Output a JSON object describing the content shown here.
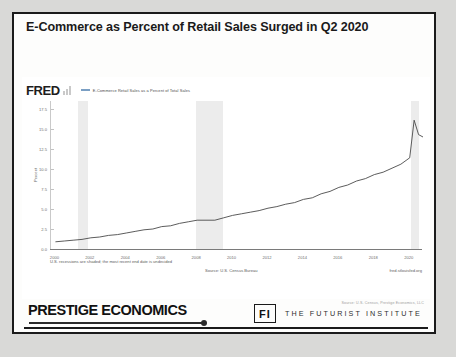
{
  "slide": {
    "title": "E-Commerce as Percent of Retail Sales Surged in Q2 2020",
    "source_note": "Source: U.S. Census, Prestige Economics, LLC"
  },
  "fred": {
    "logo": "FRED",
    "logo_mark": "bar-chart-icon",
    "legend_label": "E-Commerce Retail Sales as a Percent of Total Sales",
    "legend_color": "#7b9fc4",
    "footnote_left": "U.S. recessions are shaded; the most recent end date is undecided",
    "footnote_source": "Source: U.S. Census Bureau",
    "footnote_url": "fred.stlouisfed.org"
  },
  "brand": {
    "prestige": "PRESTIGE ECONOMICS",
    "fi_mark": "FI",
    "fi_words": "THE FUTURIST INSTITUTE"
  },
  "chart_data": {
    "type": "line",
    "title": "E-Commerce as Percent of Retail Sales Surged in Q2 2020",
    "xlabel": "",
    "ylabel": "Percent",
    "legend_position": "top",
    "grid": false,
    "xlim": [
      1999.75,
      2020.75
    ],
    "ylim": [
      0,
      18.5
    ],
    "yticks": [
      "0.0",
      "2.5",
      "5.0",
      "7.5",
      "10.0",
      "12.5",
      "15.0",
      "17.5"
    ],
    "ytick_values": [
      0.0,
      2.5,
      5.0,
      7.5,
      10.0,
      12.5,
      15.0,
      17.5
    ],
    "xticks": [
      "2000",
      "2002",
      "2004",
      "2006",
      "2008",
      "2010",
      "2012",
      "2014",
      "2016",
      "2018",
      "2020"
    ],
    "xtick_values": [
      2000,
      2002,
      2004,
      2006,
      2008,
      2010,
      2012,
      2014,
      2016,
      2018,
      2020
    ],
    "shaded_regions": [
      {
        "label": "2001 recession",
        "start": 2001.25,
        "end": 2001.83
      },
      {
        "label": "2008-2009 recession",
        "start": 2007.95,
        "end": 2009.45
      },
      {
        "label": "2020 recession",
        "start": 2020.1,
        "end": 2020.5
      }
    ],
    "series": [
      {
        "name": "E-Commerce Retail Sales as a Percent of Total Sales",
        "color": "#4a4a4a",
        "x": [
          2000.0,
          2000.5,
          2001.0,
          2001.5,
          2002.0,
          2002.5,
          2003.0,
          2003.5,
          2004.0,
          2004.5,
          2005.0,
          2005.5,
          2006.0,
          2006.5,
          2007.0,
          2007.5,
          2008.0,
          2008.5,
          2009.0,
          2009.5,
          2010.0,
          2010.5,
          2011.0,
          2011.5,
          2012.0,
          2012.5,
          2013.0,
          2013.5,
          2014.0,
          2014.5,
          2015.0,
          2015.5,
          2016.0,
          2016.5,
          2017.0,
          2017.5,
          2018.0,
          2018.5,
          2019.0,
          2019.5,
          2020.0,
          2020.25,
          2020.5,
          2020.75
        ],
        "values": [
          0.9,
          1.0,
          1.1,
          1.2,
          1.4,
          1.5,
          1.7,
          1.8,
          2.0,
          2.2,
          2.4,
          2.5,
          2.8,
          2.9,
          3.2,
          3.4,
          3.6,
          3.6,
          3.6,
          3.9,
          4.2,
          4.4,
          4.6,
          4.8,
          5.1,
          5.3,
          5.6,
          5.8,
          6.2,
          6.4,
          6.9,
          7.2,
          7.7,
          8.0,
          8.5,
          8.8,
          9.3,
          9.6,
          10.1,
          10.6,
          11.4,
          16.1,
          14.3,
          14.0
        ]
      }
    ]
  }
}
